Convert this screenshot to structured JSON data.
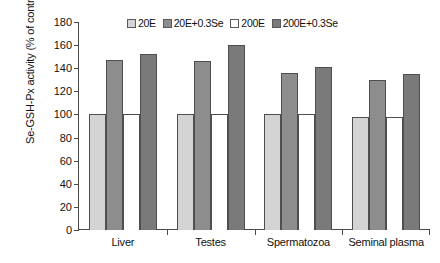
{
  "chart_data": {
    "type": "bar",
    "title": "",
    "xlabel": "",
    "ylabel": "Se-GSH-Px activity (% of control)",
    "ylim": [
      0,
      180
    ],
    "ytick_step": 20,
    "yticks": [
      180,
      160,
      140,
      120,
      100,
      80,
      60,
      40,
      20,
      0
    ],
    "grid": false,
    "legend_position": "top-center",
    "categories": [
      "Liver",
      "Testes",
      "Spermatozoa",
      "Seminal plasma"
    ],
    "series": [
      {
        "name": "20E",
        "color": "#d4d4d4",
        "values": [
          100,
          100,
          100,
          98
        ]
      },
      {
        "name": "20E+0.3Se",
        "color": "#8d8d8d",
        "values": [
          147,
          146,
          136,
          130
        ]
      },
      {
        "name": "200E",
        "color": "#ffffff",
        "values": [
          100,
          100,
          100,
          98
        ]
      },
      {
        "name": "200E+0.3Se",
        "color": "#7a7a7a",
        "values": [
          152,
          160,
          141,
          135
        ]
      }
    ]
  },
  "axis": {
    "y_title": "Se-GSH-Px activity (% of control)"
  }
}
